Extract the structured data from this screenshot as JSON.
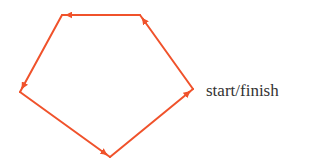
{
  "diagram": {
    "type": "closed-path",
    "shape": "pentagon",
    "stroke_color": "#f0522b",
    "label_color": "#333333",
    "vertices": [
      {
        "id": "start",
        "x": 193,
        "y": 89
      },
      {
        "id": "top-right",
        "x": 140,
        "y": 15
      },
      {
        "id": "top-left",
        "x": 62,
        "y": 15
      },
      {
        "id": "left",
        "x": 20,
        "y": 92
      },
      {
        "id": "bottom",
        "x": 110,
        "y": 157
      }
    ],
    "edges": [
      {
        "from": "start",
        "to": "top-right"
      },
      {
        "from": "top-right",
        "to": "top-left"
      },
      {
        "from": "top-left",
        "to": "left"
      },
      {
        "from": "left",
        "to": "bottom"
      },
      {
        "from": "bottom",
        "to": "start"
      }
    ],
    "labels": {
      "start_finish": "start/finish"
    }
  }
}
